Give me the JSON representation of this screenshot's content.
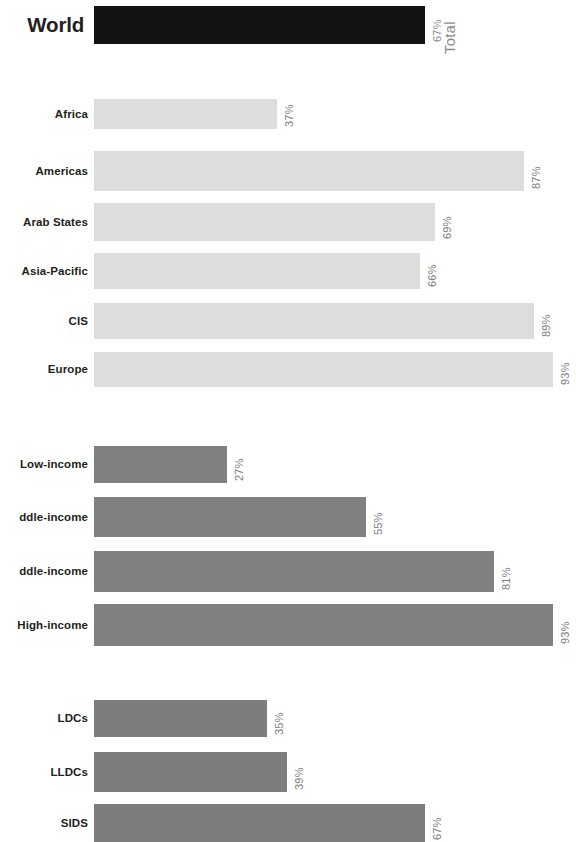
{
  "chart_data": {
    "type": "bar",
    "orientation": "horizontal",
    "title": "",
    "xlabel": "",
    "ylabel": "",
    "xlim": [
      0,
      100
    ],
    "grid": false,
    "legend": null,
    "value_suffix": "%",
    "axis_title": "Total",
    "groups": [
      {
        "name": "world",
        "style": "world",
        "categories": [
          "World"
        ],
        "values": [
          67
        ],
        "value_labels": [
          "67%"
        ]
      },
      {
        "name": "regions",
        "style": "region",
        "categories": [
          "Africa",
          "Americas",
          "Arab States",
          "Asia-Pacific",
          "CIS",
          "Europe"
        ],
        "values": [
          37,
          87,
          69,
          66,
          89,
          93
        ],
        "value_labels": [
          "37%",
          "87%",
          "69%",
          "66%",
          "89%",
          "93%"
        ]
      },
      {
        "name": "income",
        "style": "income",
        "categories": [
          "Low-income",
          "ddle-income",
          "ddle-income",
          "High-income"
        ],
        "values": [
          27,
          55,
          81,
          93
        ],
        "value_labels": [
          "27%",
          "55%",
          "81%",
          "93%"
        ]
      },
      {
        "name": "country-groups",
        "style": "group",
        "categories": [
          "LDCs",
          "LLDCs",
          "SIDS"
        ],
        "values": [
          35,
          39,
          67
        ],
        "value_labels": [
          "35%",
          "39%",
          "67%"
        ]
      }
    ],
    "colors": {
      "world_bar": "#131313",
      "region_bar": "#dddddd",
      "income_bar": "#808080",
      "group_bar": "#7d7d7d",
      "label_text": "#231f20",
      "value_text": "#8b8b8b",
      "background": "#ffffff"
    }
  }
}
